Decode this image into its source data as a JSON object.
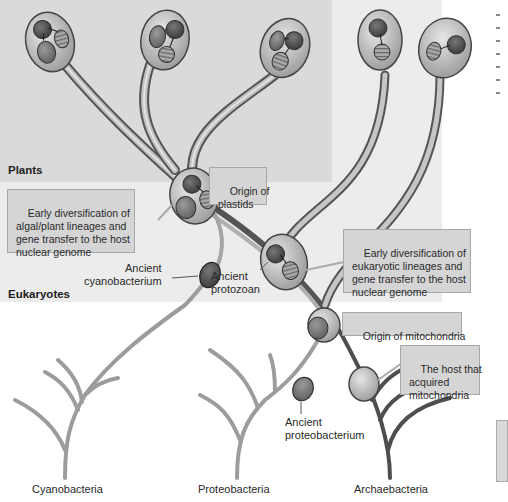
{
  "regions": {
    "plants_label": "Plants",
    "eukaryotes_label": "Eukaryotes"
  },
  "callouts": {
    "origin_plastids": "Origin of\nplastids",
    "algal_diversification": "Early diversification of\nalgal/plant lineages and\ngene transfer to the host\nnuclear genome",
    "eukaryotic_diversification": "Early diversification of\neukaryotic lineages and\ngene transfer to the host\nnuclear genome",
    "origin_mitochondria": "Origin of mitochondria",
    "host_acquired": "The host that\nacquired\nmitochondria"
  },
  "labels": {
    "ancient_cyanobacterium": "Ancient\ncyanobacterium",
    "ancient_protozoan": "Ancient\nprotozoan",
    "ancient_proteobacterium": "Ancient\nproteobacterium"
  },
  "lineages": [
    {
      "name": "Cyanobacteria"
    },
    {
      "name": "Proteobacteria"
    },
    {
      "name": "Archaebacteria"
    }
  ],
  "colors": {
    "plants_panel": "#dcdcdc",
    "eukaryote_panel": "#eeeeee",
    "dark_branch": "#505050",
    "light_branch": "#a8a8a8",
    "cell_fill": "#c4c4c4",
    "callout_fill": "#d5d5d5"
  }
}
